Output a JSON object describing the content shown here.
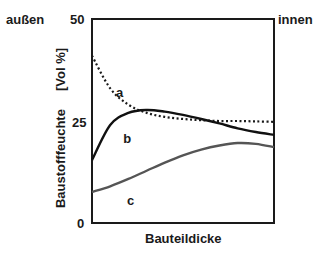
{
  "chart_data": {
    "type": "line",
    "title": "",
    "xlabel": "Bauteildicke",
    "ylabel": "Baustofffeuchte     [Vol %]",
    "ylim": [
      0,
      50
    ],
    "yticks": [
      "0",
      "25",
      "50"
    ],
    "left_annotation": "außen",
    "right_annotation": "innen",
    "grid": false,
    "x": [
      0,
      0.1,
      0.2,
      0.3,
      0.4,
      0.5,
      0.6,
      0.7,
      0.8,
      0.9,
      1.0
    ],
    "series": [
      {
        "name": "a",
        "style": "dotted",
        "color": "#1a1a1a",
        "values": [
          41,
          33,
          29,
          27,
          26,
          25.5,
          25.2,
          25,
          25,
          24.9,
          24.8
        ]
      },
      {
        "name": "b",
        "style": "solid",
        "color": "#111111",
        "values": [
          15.4,
          24,
          27,
          27.7,
          27.3,
          26.5,
          25.5,
          24.4,
          23.2,
          22.3,
          21.6
        ]
      },
      {
        "name": "c",
        "style": "solid",
        "color": "#555555",
        "values": [
          7.6,
          9,
          10.8,
          12.8,
          14.8,
          16.6,
          18,
          19,
          19.6,
          19.4,
          18.6
        ]
      }
    ]
  }
}
